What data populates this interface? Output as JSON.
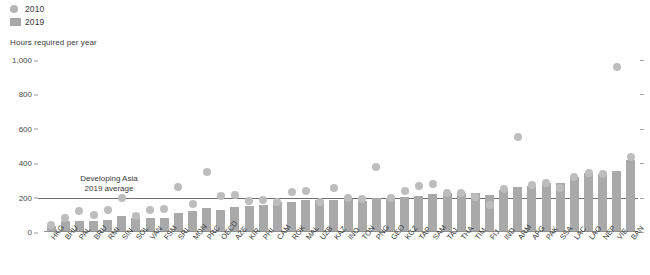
{
  "legend": {
    "items": [
      {
        "label": "2010",
        "marker": "circle-marker-icon",
        "color": "#b5b5b5"
      },
      {
        "label": "2019",
        "marker": "square-marker-icon",
        "color": "#a8a8a8"
      }
    ]
  },
  "axis_title": "Hours required per year",
  "annotation": {
    "line1": "Developing Asia",
    "line2": "2019 average",
    "value": 200
  },
  "chart_data": {
    "type": "bar",
    "title": "",
    "subtitle": "",
    "xlabel": "",
    "ylabel": "Hours required per year",
    "ylim": [
      0,
      1000
    ],
    "yticks": [
      0,
      200,
      400,
      600,
      800,
      1000
    ],
    "ytick_labels": [
      "0",
      "200",
      "400",
      "600",
      "800",
      "1,000"
    ],
    "grid": false,
    "legend_position": "top-left",
    "reference_line": {
      "label": "Developing Asia 2019 average",
      "value": 200
    },
    "categories": [
      "HKG",
      "BHU",
      "PAL",
      "BRU",
      "RMI",
      "SIN",
      "SOL",
      "VAN",
      "FSM",
      "SRI",
      "MON",
      "PRC",
      "OECD",
      "AZE",
      "KIR",
      "PHI",
      "CAM",
      "ROK",
      "MAL",
      "UZB",
      "KAZ",
      "INO",
      "TON",
      "PNG",
      "GEO",
      "KGZ",
      "TAP",
      "SAM",
      "TAJ",
      "THA",
      "TIM",
      "FIJ",
      "IND",
      "ARM",
      "AFG",
      "PAK",
      "SSA",
      "LAC",
      "LAO",
      "NEP",
      "VIE",
      "BAN"
    ],
    "series": [
      {
        "name": "2019",
        "type": "bar",
        "color": "#a9a9a9",
        "values": [
          35,
          63,
          65,
          66,
          68,
          95,
          80,
          80,
          84,
          110,
          120,
          138,
          130,
          145,
          152,
          155,
          173,
          174,
          188,
          186,
          186,
          191,
          181,
          198,
          198,
          205,
          210,
          221,
          224,
          229,
          226,
          218,
          247,
          260,
          268,
          283,
          284,
          317,
          342,
          339,
          352,
          420
        ]
      },
      {
        "name": "2010",
        "type": "scatter",
        "color": "#bdbdbd",
        "values": [
          40,
          80,
          123,
          101,
          130,
          197,
          92,
          130,
          135,
          259,
          162,
          350,
          207,
          213,
          180,
          186,
          173,
          231,
          240,
          172,
          255,
          200,
          191,
          380,
          198,
          241,
          270,
          278,
          224,
          229,
          205,
          155,
          249,
          550,
          275,
          283,
          253,
          317,
          342,
          339,
          960,
          435
        ]
      }
    ]
  }
}
